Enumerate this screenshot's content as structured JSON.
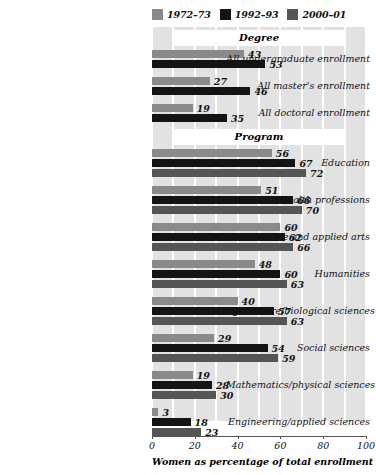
{
  "chart_data": {
    "type": "bar",
    "orientation": "horizontal",
    "title": "",
    "xlabel": "Women as percentage of total enrollment",
    "ylabel": "",
    "xlim": [
      0,
      100
    ],
    "xticks": [
      "0",
      "20",
      "40",
      "60",
      "80",
      "100"
    ],
    "grid": true,
    "grid_interval": 10,
    "legend_position": "top",
    "series": [
      {
        "name": "1972–73",
        "color": "#8a8a8a"
      },
      {
        "name": "1992–93",
        "color": "#141414"
      },
      {
        "name": "2000–01",
        "color": "#555555"
      }
    ],
    "sections": [
      {
        "label": "Degree",
        "categories": [
          {
            "label": "All undergraduate enrollment",
            "values": [
              43,
              53,
              null
            ]
          },
          {
            "label": "All master's enrollment",
            "values": [
              27,
              46,
              null
            ]
          },
          {
            "label": "All doctoral enrollment",
            "values": [
              19,
              35,
              null
            ]
          }
        ]
      },
      {
        "label": "Program",
        "categories": [
          {
            "label": "Education",
            "values": [
              56,
              67,
              72
            ]
          },
          {
            "label": "Health professions",
            "values": [
              51,
              66,
              70
            ]
          },
          {
            "label": "Fine and applied arts",
            "values": [
              60,
              62,
              66
            ]
          },
          {
            "label": "Humanities",
            "values": [
              48,
              60,
              63
            ]
          },
          {
            "label": "Agriculture/biological sciences",
            "values": [
              40,
              57,
              63
            ]
          },
          {
            "label": "Social sciences",
            "values": [
              29,
              54,
              59
            ]
          },
          {
            "label": "Mathematics/physical sciences",
            "values": [
              19,
              28,
              30
            ]
          },
          {
            "label": "Engineering/applied sciences",
            "values": [
              3,
              18,
              23
            ]
          }
        ]
      }
    ]
  },
  "colors": {
    "plot_background": "#e2e2e2",
    "gridline": "#ffffff",
    "banner_background": "#ffffff",
    "axis": "#555555",
    "text": "#111111"
  }
}
